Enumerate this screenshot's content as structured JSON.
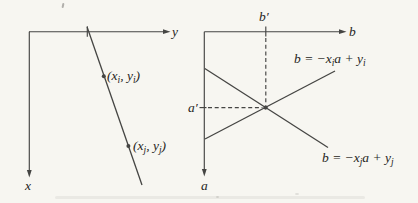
{
  "colors": {
    "background": "#f7f6f1",
    "ink": "#454543",
    "text": "#262522"
  },
  "left_plot": {
    "y_axis_label": "y",
    "x_axis_label": "x",
    "point_i": {
      "open": "(x",
      "sub1": "i",
      "mid": ", y",
      "sub2": "i",
      "close": ")"
    },
    "point_j": {
      "open": "(x",
      "sub1": "j",
      "mid": ", y",
      "sub2": "j",
      "close": ")"
    }
  },
  "right_plot": {
    "b_axis_label": "b",
    "a_axis_label": "a",
    "b_prime_label": "b′",
    "a_prime_label": "a′",
    "eq_i": {
      "lhs": "b = −x",
      "sub1": "i",
      "mid": "a + y",
      "sub2": "i"
    },
    "eq_j": {
      "lhs": "b = −x",
      "sub1": "j",
      "mid": "a + y",
      "sub2": "j"
    }
  }
}
